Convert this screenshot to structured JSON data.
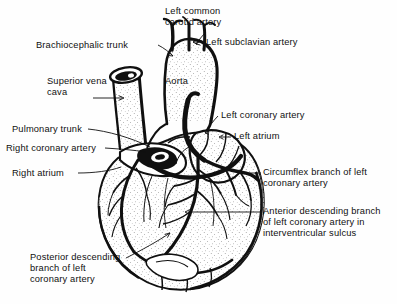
{
  "figure": {
    "kind": "anatomical-illustration",
    "style": "black-and-white line drawing with stipple shading",
    "background_color": "#fefefe",
    "ink_color": "#101010"
  },
  "labels": [
    {
      "id": "brachiocephalic-trunk",
      "text": "Brachiocephalic trunk",
      "lines": [
        "Brachiocephalic trunk"
      ],
      "x": 36,
      "y": 40,
      "align": "left",
      "leader": [
        [
          158,
          45
        ],
        [
          173,
          56
        ]
      ],
      "arrow": "end"
    },
    {
      "id": "left-common-carotid-artery",
      "text": "Left common carotid artery",
      "lines": [
        "Left common",
        "carotid artery"
      ],
      "x": 165,
      "y": 6,
      "align": "left",
      "leader": [
        [
          206,
          32
        ],
        [
          196,
          44
        ]
      ],
      "arrow": "end"
    },
    {
      "id": "left-subclavian-artery",
      "text": "Left subclavian artery",
      "lines": [
        "Left subclavian artery"
      ],
      "x": 203,
      "y": 38,
      "align": "left",
      "leader": [
        [
          202,
          42
        ],
        [
          194,
          42
        ]
      ],
      "arrow": "none"
    },
    {
      "id": "superior-vena-cava",
      "text": "Superior vena cava",
      "lines": [
        "Superior vena",
        "cava"
      ],
      "x": 47,
      "y": 76,
      "align": "left",
      "leader": [
        [
          93,
          98
        ],
        [
          124,
          98
        ]
      ],
      "arrow": "end"
    },
    {
      "id": "aorta",
      "text": "Aorta",
      "lines": [
        "Aorta"
      ],
      "x": 165,
      "y": 77,
      "align": "left",
      "leader": null,
      "arrow": "none"
    },
    {
      "id": "left-coronary-artery",
      "text": "Left coronary artery",
      "lines": [
        "Left coronary artery"
      ],
      "x": 220,
      "y": 111,
      "align": "left",
      "leader": [
        [
          218,
          116
        ],
        [
          205,
          133
        ]
      ],
      "arrow": "end"
    },
    {
      "id": "left-atrium",
      "text": "Left atrium",
      "lines": [
        "Left atrium"
      ],
      "x": 232,
      "y": 133,
      "align": "left",
      "leader": [
        [
          230,
          137
        ],
        [
          219,
          137
        ]
      ],
      "arrow": "end"
    },
    {
      "id": "pulmonary-trunk",
      "text": "Pulmonary trunk",
      "lines": [
        "Pulmonary trunk"
      ],
      "x": 12,
      "y": 124,
      "align": "left",
      "leader": [
        [
          88,
          129
        ],
        [
          150,
          147
        ]
      ],
      "arrow": "none"
    },
    {
      "id": "right-coronary-artery",
      "text": "Right coronary artery",
      "lines": [
        "Right coronary artery"
      ],
      "x": 6,
      "y": 143,
      "align": "left",
      "leader": [
        [
          105,
          148
        ],
        [
          146,
          152
        ]
      ],
      "arrow": "none"
    },
    {
      "id": "right-atrium",
      "text": "Right atrium",
      "lines": [
        "Right atrium"
      ],
      "x": 12,
      "y": 168,
      "align": "left",
      "leader": [
        [
          78,
          173
        ],
        [
          120,
          168
        ]
      ],
      "arrow": "none"
    },
    {
      "id": "circumflex-branch",
      "text": "Circumflex branch of left coronary artery",
      "lines": [
        "Circumflex branch of left",
        "coronary artery"
      ],
      "x": 262,
      "y": 168,
      "align": "left",
      "leader": [
        [
          261,
          173
        ],
        [
          243,
          173
        ]
      ],
      "arrow": "none"
    },
    {
      "id": "anterior-descending-branch",
      "text": "Anterior descending branch of left coronary artery in interventricular sulcus",
      "lines": [
        "Anterior descending branch",
        "of left coronary artery in",
        "interventricular sulcus"
      ],
      "x": 262,
      "y": 207,
      "align": "left",
      "leader": [
        [
          260,
          212
        ],
        [
          185,
          212
        ]
      ],
      "arrow": "end"
    },
    {
      "id": "posterior-descending-branch",
      "text": "Posterior descending branch of left coronary artery",
      "lines": [
        "Posterior descending",
        "branch of left",
        "coronary artery"
      ],
      "x": 30,
      "y": 253,
      "align": "left",
      "leader": [
        [
          126,
          258
        ],
        [
          170,
          233
        ]
      ],
      "arrow": "end"
    }
  ],
  "structures": [
    "aortic arch",
    "ascending aorta",
    "brachiocephalic trunk",
    "left common carotid artery",
    "left subclavian artery",
    "superior vena cava",
    "pulmonary trunk",
    "right atrium",
    "left atrium",
    "right ventricle",
    "left ventricle",
    "right coronary artery",
    "left coronary artery",
    "circumflex branch",
    "anterior descending branch",
    "posterior descending branch"
  ]
}
